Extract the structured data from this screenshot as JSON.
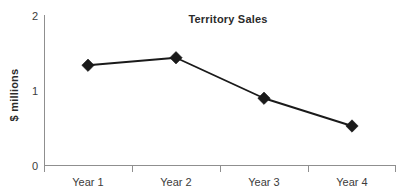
{
  "chart_data": {
    "type": "line",
    "title": "Territory Sales",
    "xlabel": "",
    "ylabel": "$ millions",
    "categories": [
      "Year 1",
      "Year 2",
      "Year 3",
      "Year 4"
    ],
    "values": [
      1.33,
      1.43,
      0.89,
      0.52
    ],
    "series": [
      {
        "name": "Territory Sales",
        "values": [
          1.33,
          1.43,
          0.89,
          0.52
        ]
      }
    ],
    "ylim": [
      0,
      2
    ],
    "yticks": [
      0,
      1,
      2
    ],
    "ytick_labels": [
      "0",
      "1",
      "2"
    ],
    "grid": false,
    "legend": false,
    "legend_position": "none",
    "marker": "diamond",
    "line_color": "#1a1a1a",
    "marker_color": "#1a1a1a",
    "axis_color": "#8f8f8f",
    "text_color": "#3c3c3c",
    "title_color": "#2b2b2b",
    "background_color": "#ffffff"
  },
  "axis": {
    "y_tick_0": "0",
    "y_tick_1": "1",
    "y_tick_2": "2",
    "y_axis_title": "$ millions"
  },
  "categories": {
    "c0": "Year 1",
    "c1": "Year 2",
    "c2": "Year 3",
    "c3": "Year 4"
  },
  "title": {
    "text": "Territory Sales"
  }
}
